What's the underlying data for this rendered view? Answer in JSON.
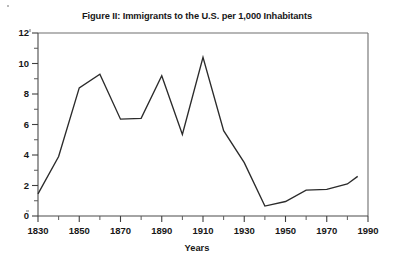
{
  "figure": {
    "title": "Figure II: Immigrants to the U.S. per 1,000 Inhabitants",
    "x_axis_title": "Years"
  },
  "chart_data": {
    "type": "line",
    "title": "Figure II: Immigrants to the U.S. per 1,000 Inhabitants",
    "xlabel": "Years",
    "ylabel": "",
    "xlim": [
      1830,
      1990
    ],
    "ylim": [
      0,
      12
    ],
    "grid": false,
    "legend": "none",
    "x_major_tick_step": 20,
    "x_minor_tick_step": 10,
    "y_major_tick_step": 2,
    "y_minor_tick_step": 1,
    "x_tick_labels": [
      "1830",
      "1850",
      "1870",
      "1890",
      "1910",
      "1930",
      "1950",
      "1970",
      "1990"
    ],
    "x_tick_values": [
      1830,
      1850,
      1870,
      1890,
      1910,
      1930,
      1950,
      1970,
      1990
    ],
    "y_tick_labels": [
      "0",
      "2",
      "4",
      "6",
      "8",
      "10",
      "12"
    ],
    "y_tick_values": [
      0,
      2,
      4,
      6,
      8,
      10,
      12
    ],
    "series": [
      {
        "name": "Immigrants per 1,000 inhabitants",
        "color": "#2b2b2b",
        "x": [
          1830,
          1840,
          1850,
          1860,
          1870,
          1880,
          1890,
          1900,
          1910,
          1920,
          1930,
          1940,
          1950,
          1960,
          1970,
          1980,
          1985
        ],
        "values": [
          1.45,
          3.9,
          8.4,
          9.3,
          6.35,
          6.4,
          9.2,
          5.35,
          10.4,
          5.6,
          3.5,
          0.65,
          0.95,
          1.7,
          1.75,
          2.1,
          2.6
        ]
      }
    ],
    "annotations": []
  },
  "colors": {
    "line": "#2b2b2b",
    "axis": "#4a4a4a",
    "frame": "#6e6e6e",
    "text": "#171717",
    "background": "#ffffff"
  }
}
